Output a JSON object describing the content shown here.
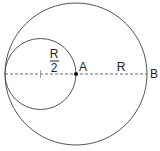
{
  "diagram": {
    "type": "geometry",
    "colors": {
      "stroke": "#555555",
      "text": "#222222",
      "background": "#ffffff"
    },
    "large_circle": {
      "cx": 76,
      "cy": 74,
      "r": 71
    },
    "small_circle": {
      "cx": 40.5,
      "cy": 74,
      "r": 35.5
    },
    "labels": {
      "small_radius_numerator": "R",
      "small_radius_denominator": "2",
      "point_a": "A",
      "large_radius": "R",
      "point_b": "B"
    }
  }
}
